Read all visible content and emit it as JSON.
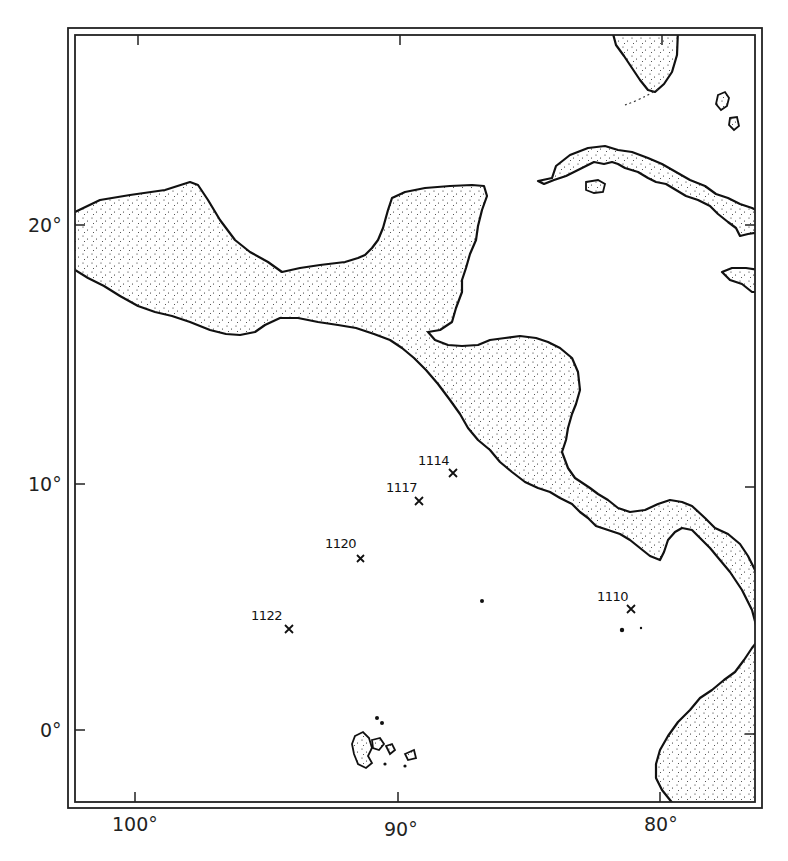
{
  "map": {
    "title": "",
    "region": "Central America and eastern equatorial Pacific",
    "latitude_labels": [
      {
        "label": "20°",
        "y": 225
      },
      {
        "label": "10°",
        "y": 484
      },
      {
        "label": "0°",
        "y": 730
      }
    ],
    "longitude_labels": [
      {
        "label": "100°",
        "x": 137
      },
      {
        "label": "90°",
        "x": 400
      },
      {
        "label": "80°",
        "x": 662
      }
    ],
    "sites": [
      {
        "id": "1114",
        "label": "1114",
        "x": 453,
        "y": 473
      },
      {
        "id": "1117",
        "label": "1117",
        "x": 419,
        "y": 501
      },
      {
        "id": "1120",
        "label": "1120",
        "x": 360,
        "y": 558
      },
      {
        "id": "1122",
        "label": "1122",
        "x": 289,
        "y": 629
      },
      {
        "id": "1110",
        "label": "1110",
        "x": 631,
        "y": 609
      }
    ],
    "landmasses": [
      "Mexico",
      "Yucatan Peninsula",
      "Central America",
      "Cuba",
      "Florida",
      "Hispaniola",
      "Jamaica",
      "South America",
      "Galapagos Islands"
    ],
    "colors": {
      "ink": "#111111",
      "background": "#ffffff",
      "stipple": "#1a1a1a"
    }
  }
}
